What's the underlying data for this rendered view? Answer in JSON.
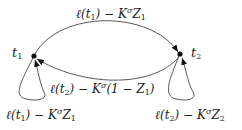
{
  "diagram": {
    "type": "state-transition-graph",
    "nodes": [
      {
        "id": "t1",
        "label": "t",
        "sub": "1",
        "x": 34,
        "y": 56
      },
      {
        "id": "t2",
        "label": "t",
        "sub": "2",
        "x": 180,
        "y": 54
      }
    ],
    "edges": [
      {
        "id": "t1-to-t2",
        "from": "t1",
        "to": "t2",
        "label": {
          "pre": "ℓ(t",
          "sub1": "1",
          "mid": ") − K",
          "sup": "σ",
          "post": "Z",
          "sub2": "1",
          "tail": ""
        }
      },
      {
        "id": "t2-to-t1",
        "from": "t2",
        "to": "t1",
        "label": {
          "pre": "ℓ(t",
          "sub1": "2",
          "mid": ") − K",
          "sup": "σ",
          "post": "(1 − Z",
          "sub2": "1",
          "tail": ")"
        }
      },
      {
        "id": "t1-self",
        "from": "t1",
        "to": "t1",
        "label": {
          "pre": "ℓ(t",
          "sub1": "1",
          "mid": ") − K",
          "sup": "σ",
          "post": "Z",
          "sub2": "1",
          "tail": ""
        }
      },
      {
        "id": "t2-self",
        "from": "t2",
        "to": "t2",
        "label": {
          "pre": "ℓ(t",
          "sub1": "2",
          "mid": ") − K",
          "sup": "σ",
          "post": "Z",
          "sub2": "2",
          "tail": ""
        }
      }
    ],
    "colors": {
      "stroke": "#333333",
      "node": "#111111",
      "text": "#222222"
    }
  }
}
